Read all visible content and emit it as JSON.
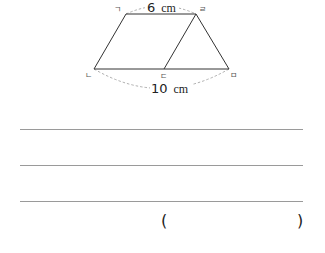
{
  "figure": {
    "vertices": [
      {
        "label": "ㄱ",
        "x": 126,
        "y": 14
      },
      {
        "label": "ㄴ",
        "x": 94,
        "y": 69
      },
      {
        "label": "ㄷ",
        "x": 164,
        "y": 69
      },
      {
        "label": "ㄹ",
        "x": 196,
        "y": 14
      },
      {
        "label": "ㅁ",
        "x": 229,
        "y": 69
      }
    ],
    "labels": {
      "g": "ㄱ",
      "n": "ㄴ",
      "d": "ㄷ",
      "r": "ㄹ",
      "m": "ㅁ"
    },
    "top_measure": {
      "value": "6",
      "unit": "cm"
    },
    "bottom_measure": {
      "value": "10",
      "unit": "cm"
    },
    "colors": {
      "stroke": "#333333",
      "dashed_arc": "#999999"
    }
  },
  "answer_area": {
    "line_count": 3,
    "open_paren": "(",
    "close_paren": ")",
    "answer_value": ""
  }
}
